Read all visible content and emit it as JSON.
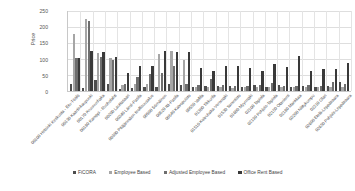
{
  "chart_data": {
    "type": "bar",
    "title": "",
    "xlabel": "",
    "ylabel": "Price",
    "ylim": [
      0,
      250
    ],
    "yticks": [
      0,
      50,
      100,
      150,
      200,
      250
    ],
    "grid": true,
    "legend_position": "bottom",
    "categories": [
      "00100 Helsinki Keskusta - Etu-Töölö",
      "00130 Kaartinkaupunki",
      "00170 Kruununhaka",
      "00180 Kamppi - Ruoholahti",
      "00200 Lauttasaari",
      "00240 Länsi-Pasila",
      "00380 Pitäjänmäen teollisuusalue",
      "00500 Sörnäinen",
      "00520 Itä-Pasila",
      "00540 Kaivopuisto",
      "00550 Vallila",
      "01300 Tikkurila",
      "01510 Koivuhaka-Veromäki",
      "01530 Tammisto",
      "01600 Myyrmäki",
      "02100 Tapiola",
      "02130 Pohjois-Tapiola",
      "02150 Otaniemi",
      "02180 Mankkaa",
      "02200 Niittykumpu",
      "02210 Olari",
      "02600 Etelä-Leppävaara",
      "02650 Pohjois-Leppävaara"
    ],
    "series": [
      {
        "name": "FiCORA",
        "color": "#4d4d4d",
        "values": [
          21,
          10,
          33,
          21,
          7,
          10,
          12,
          11,
          22,
          20,
          14,
          15,
          17,
          15,
          13,
          20,
          14,
          20,
          14,
          15,
          13,
          17,
          27
        ]
      },
      {
        "name": "Employee Based",
        "color": "#a6a6a6",
        "values": [
          179,
          225,
          118,
          104,
          19,
          21,
          22,
          115,
          126,
          96,
          12,
          11,
          13,
          10,
          11,
          12,
          12,
          13,
          11,
          12,
          11,
          12,
          14
        ]
      },
      {
        "name": "Adjusted Employee Based",
        "color": "#6e6e6e",
        "values": [
          103,
          220,
          107,
          96,
          23,
          44,
          53,
          55,
          78,
          23,
          18,
          36,
          19,
          17,
          16,
          20,
          26,
          16,
          16,
          19,
          17,
          29,
          21
        ]
      },
      {
        "name": "Office Rent Based",
        "color": "#393939",
        "values": [
          104,
          126,
          121,
          105,
          56,
          77,
          79,
          124,
          123,
          122,
          72,
          62,
          79,
          79,
          72,
          64,
          83,
          74,
          108,
          62,
          69,
          69,
          86
        ]
      }
    ]
  },
  "legend": {
    "items": [
      {
        "label": "FiCORA"
      },
      {
        "label": "Employee Based"
      },
      {
        "label": "Adjusted Employee Based"
      },
      {
        "label": "Office Rent Based"
      }
    ]
  }
}
